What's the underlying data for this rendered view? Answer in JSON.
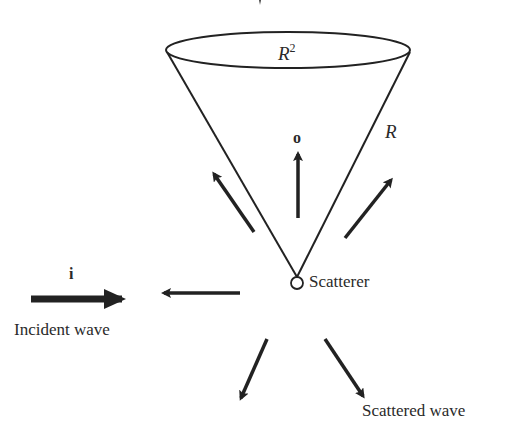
{
  "diagram": {
    "type": "scattering-geometry",
    "colors": {
      "stroke": "#222222",
      "text": "#2a2a2a",
      "background": "#ffffff"
    },
    "labels": {
      "cone_top": "R",
      "cone_top_sup": "2",
      "cone_side": "R",
      "outgoing_vector": "o",
      "incident_vector": "i",
      "incident_wave": "Incident wave",
      "scatterer": "Scatterer",
      "scattered_wave": "Scattered wave"
    },
    "elements": {
      "cone": {
        "apex": [
          297,
          276
        ],
        "ellipse_center": [
          288,
          50
        ],
        "rx": 122,
        "ry": 18
      },
      "scatterer_circle": {
        "center": [
          297,
          283
        ],
        "r": 6
      },
      "incident_arrow": {
        "from": [
          31,
          299
        ],
        "to": [
          137,
          299
        ],
        "thickness": "thick"
      },
      "scattered_arrows": [
        {
          "name": "up",
          "from": [
            298,
            218
          ],
          "to": [
            298,
            152
          ]
        },
        {
          "name": "upper-left",
          "from": [
            254,
            232
          ],
          "to": [
            212,
            171
          ]
        },
        {
          "name": "upper-right",
          "from": [
            345,
            238
          ],
          "to": [
            393,
            177
          ]
        },
        {
          "name": "left",
          "from": [
            240,
            293
          ],
          "to": [
            161,
            293
          ]
        },
        {
          "name": "lower-left",
          "from": [
            267,
            339
          ],
          "to": [
            239,
            401
          ]
        },
        {
          "name": "lower-right",
          "from": [
            325,
            339
          ],
          "to": [
            365,
            399
          ]
        }
      ]
    }
  }
}
